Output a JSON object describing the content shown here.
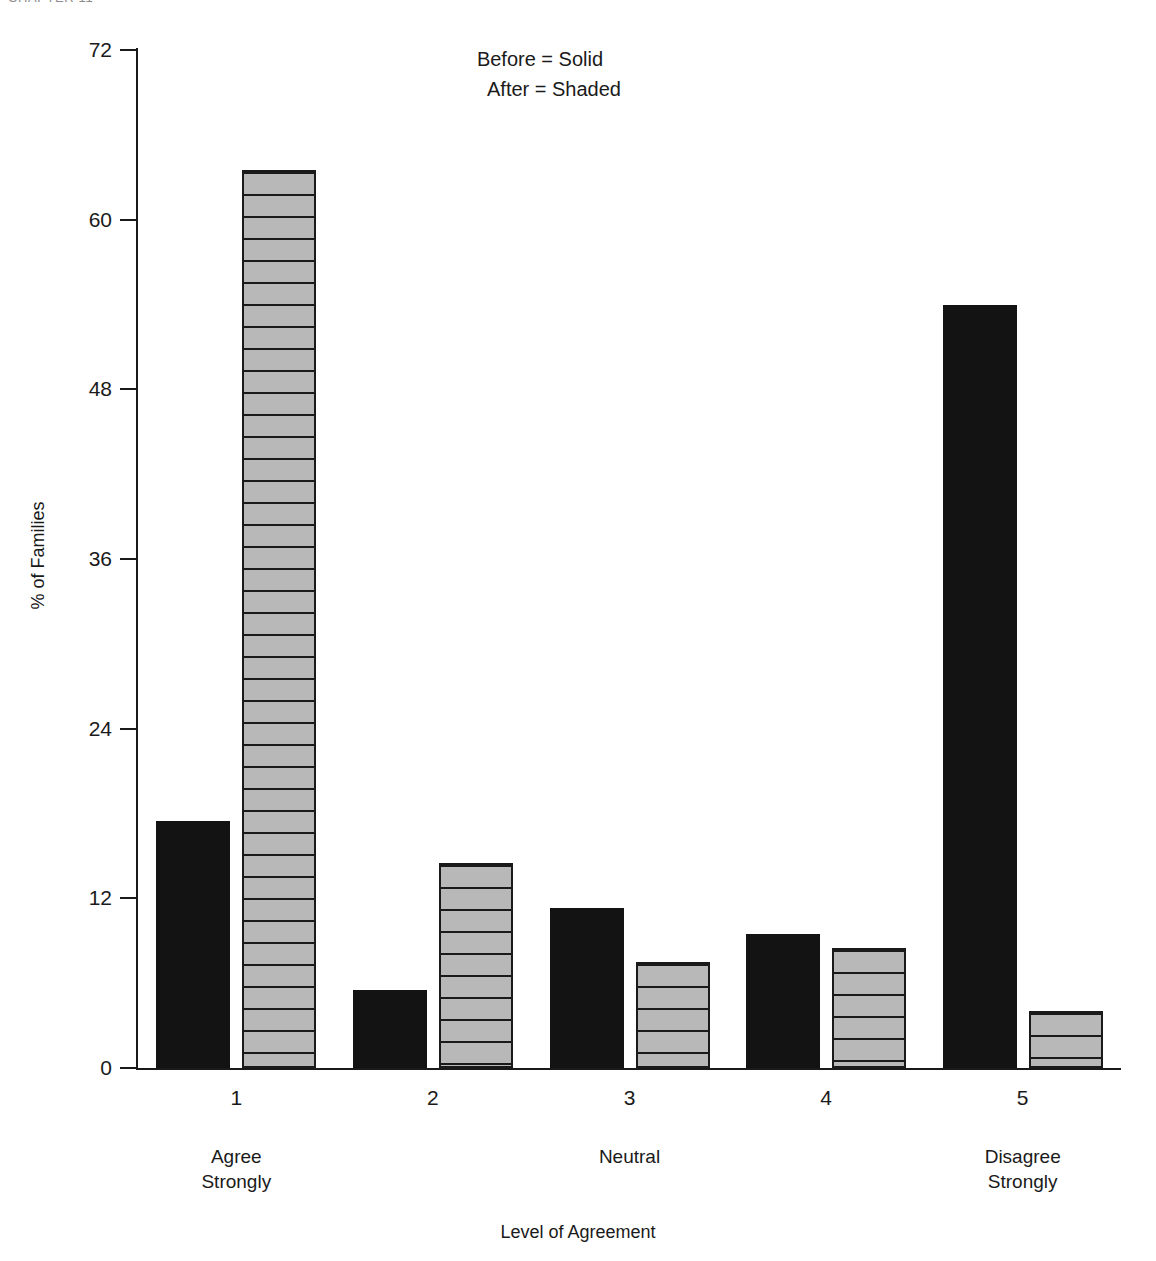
{
  "page": {
    "running_header": "CHAPTER 11"
  },
  "chart_data": {
    "type": "bar",
    "title": "",
    "xlabel": "Level of Agreement",
    "ylabel": "% of Families",
    "categories": [
      "1",
      "2",
      "3",
      "4",
      "5"
    ],
    "category_descriptions": [
      "Agree\nStrongly",
      "",
      "Neutral",
      "",
      "Disagree\nStrongly"
    ],
    "series": [
      {
        "name": "Before",
        "style": "Solid",
        "values": [
          17.5,
          5.5,
          11.3,
          9.5,
          54.0
        ]
      },
      {
        "name": "After",
        "style": "Shaded",
        "values": [
          63.5,
          14.5,
          7.5,
          8.5,
          4.0
        ]
      }
    ],
    "ylim": [
      0,
      72
    ],
    "yticks": [
      0,
      12,
      24,
      36,
      48,
      60,
      72
    ],
    "ytick_labels": [
      "0",
      "12",
      "24",
      "36",
      "48",
      "60",
      "72"
    ],
    "grid": false,
    "legend_position": "top-center"
  },
  "legend": {
    "line1": "Before = Solid",
    "line2": "After = Shaded"
  },
  "axis": {
    "y_title": "% of Families",
    "x_title": "Level of Agreement"
  },
  "xaxis": {
    "ticks": [
      "1",
      "2",
      "3",
      "4",
      "5"
    ],
    "group_labels": [
      {
        "index": 0,
        "text": "Agree\nStrongly"
      },
      {
        "index": 2,
        "text": "Neutral"
      },
      {
        "index": 4,
        "text": "Disagree\nStrongly"
      }
    ]
  },
  "colors": {
    "solid_bar": "#131313",
    "shaded_bar_fill": "#b8b8b8",
    "shaded_bar_stroke": "#1a1a1a",
    "axis": "#1a1a1a",
    "background": "#ffffff"
  }
}
